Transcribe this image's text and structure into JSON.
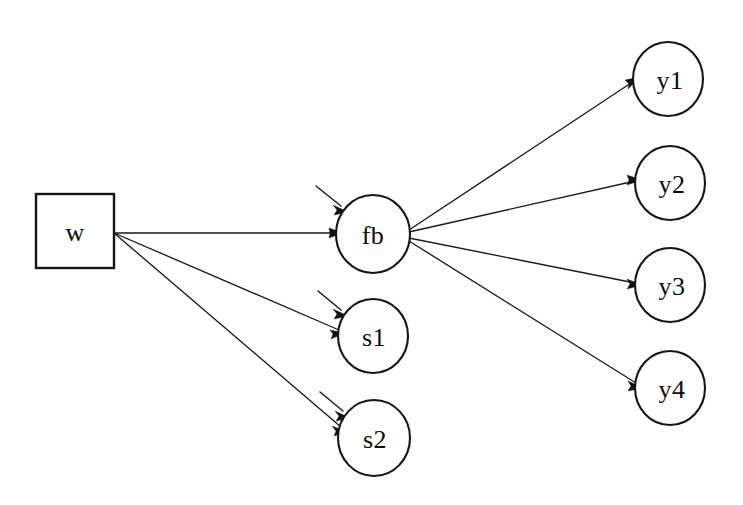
{
  "diagram": {
    "background_color": "#ffffff",
    "line_color": "#1a1a1a",
    "text_color": "#0b0b0b",
    "type": "path-diagram",
    "nodes": [
      {
        "id": "w",
        "label": "w",
        "shape": "rectangle",
        "cx": 75,
        "cy": 231,
        "w": 78,
        "h": 74,
        "role": "observed-exogenous"
      },
      {
        "id": "fb",
        "label": "fb",
        "shape": "ellipse",
        "cx": 373,
        "cy": 234,
        "rx": 37,
        "ry": 39,
        "role": "latent-variable"
      },
      {
        "id": "s1",
        "label": "s1",
        "shape": "ellipse",
        "cx": 373,
        "cy": 336,
        "rx": 35,
        "ry": 37,
        "role": "latent-variable"
      },
      {
        "id": "s2",
        "label": "s2",
        "shape": "ellipse",
        "cx": 374,
        "cy": 438,
        "rx": 36,
        "ry": 38,
        "role": "latent-variable"
      },
      {
        "id": "y1",
        "label": "y1",
        "shape": "ellipse",
        "cx": 668,
        "cy": 79,
        "rx": 35,
        "ry": 37,
        "role": "indicator"
      },
      {
        "id": "y2",
        "label": "y2",
        "shape": "ellipse",
        "cx": 670,
        "cy": 183,
        "rx": 35,
        "ry": 37,
        "role": "indicator"
      },
      {
        "id": "y3",
        "label": "y3",
        "shape": "ellipse",
        "cx": 670,
        "cy": 285,
        "rx": 35,
        "ry": 37,
        "role": "indicator"
      },
      {
        "id": "y4",
        "label": "y4",
        "shape": "ellipse",
        "cx": 670,
        "cy": 388,
        "rx": 35,
        "ry": 37,
        "role": "indicator"
      }
    ],
    "edges": [
      {
        "id": "w-fb",
        "from": "w",
        "to": "fb",
        "x1": 114,
        "y1": 233,
        "x2": 336,
        "y2": 233
      },
      {
        "id": "w-s1",
        "from": "w",
        "to": "s1",
        "x1": 114,
        "y1": 233,
        "x2": 339,
        "y2": 330
      },
      {
        "id": "w-s2",
        "from": "w",
        "to": "s2",
        "x1": 114,
        "y1": 233,
        "x2": 341,
        "y2": 427
      },
      {
        "id": "fb-y1",
        "from": "fb",
        "to": "y1",
        "x1": 409,
        "y1": 230,
        "x2": 634,
        "y2": 81
      },
      {
        "id": "fb-y2",
        "from": "fb",
        "to": "y2",
        "x1": 409,
        "y1": 232,
        "x2": 635,
        "y2": 181
      },
      {
        "id": "fb-y3",
        "from": "fb",
        "to": "y3",
        "x1": 409,
        "y1": 238,
        "x2": 635,
        "y2": 283
      },
      {
        "id": "fb-y4",
        "from": "fb",
        "to": "y4",
        "x1": 409,
        "y1": 241,
        "x2": 636,
        "y2": 383
      }
    ],
    "residuals": [
      {
        "id": "res-fb",
        "to": "fb",
        "x1": 316,
        "y1": 186,
        "x2": 346,
        "y2": 210
      },
      {
        "id": "res-s1",
        "to": "s1",
        "x1": 318,
        "y1": 291,
        "x2": 346,
        "y2": 314
      },
      {
        "id": "res-s2",
        "to": "s2",
        "x1": 320,
        "y1": 392,
        "x2": 348,
        "y2": 416
      }
    ]
  }
}
